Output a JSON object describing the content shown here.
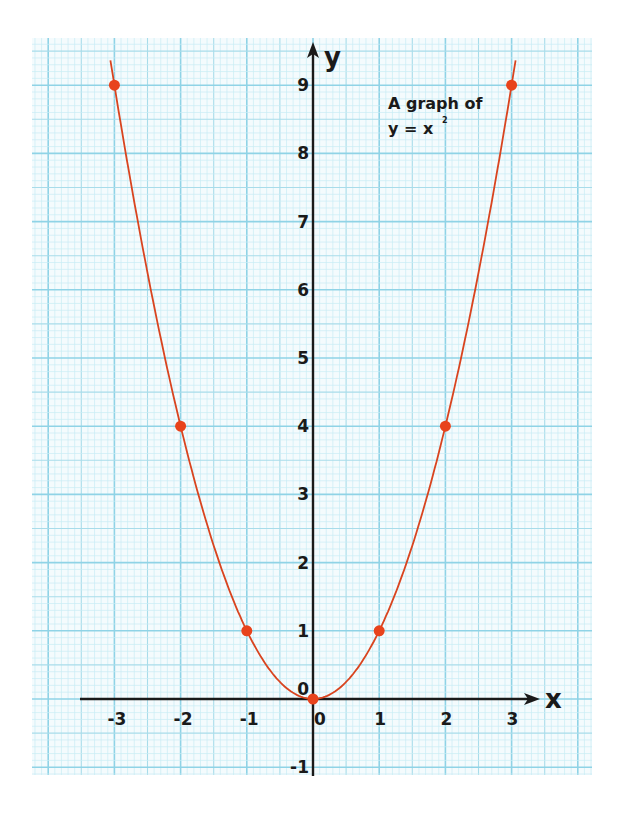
{
  "chart_data": {
    "type": "line",
    "title_lines": [
      "A graph of",
      "y = x"
    ],
    "title_superscript": "2",
    "xlabel": "x",
    "ylabel": "y",
    "x": [
      -3,
      -2,
      -1,
      0,
      1,
      2,
      3
    ],
    "y": [
      9,
      4,
      1,
      0,
      1,
      4,
      9
    ],
    "series": [
      {
        "name": "y = x^2",
        "x": [
          -3,
          -2,
          -1,
          0,
          1,
          2,
          3
        ],
        "values": [
          9,
          4,
          1,
          0,
          1,
          4,
          9
        ]
      }
    ],
    "xticks": [
      "-3",
      "-2",
      "-1",
      "0",
      "1",
      "2",
      "3"
    ],
    "yticks": [
      "-1",
      "0",
      "1",
      "2",
      "3",
      "4",
      "5",
      "6",
      "7",
      "8",
      "9"
    ],
    "xlim": [
      -4.2,
      4.2
    ],
    "ylim": [
      -1.1,
      9.7
    ],
    "grid": true,
    "legend": "none",
    "colors": {
      "curve": "#d9441f",
      "points": "#e8431c",
      "grid_major": "#8fd3e6",
      "grid_minor": "#c9ecf5",
      "axis": "#1a1a1a"
    }
  }
}
